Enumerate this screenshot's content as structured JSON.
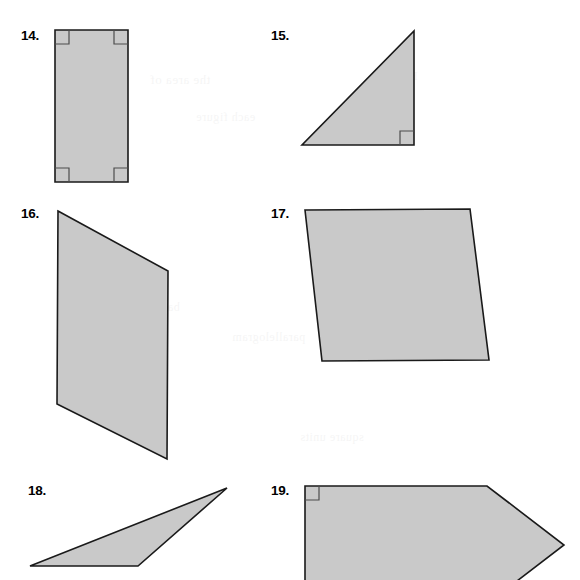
{
  "page": {
    "background_color": "#ffffff",
    "width": 580,
    "height": 580
  },
  "style": {
    "shape_fill": "#c9c9c9",
    "shape_stroke": "#1a1a1a",
    "shape_stroke_width": 1.6,
    "marker_stroke": "#4d4d4d",
    "marker_stroke_width": 1.2,
    "label_color": "#000000"
  },
  "ghost_text": [
    {
      "text": "the area of",
      "x": 150,
      "y": 72,
      "size": 13
    },
    {
      "text": "Find",
      "x": 392,
      "y": 68,
      "size": 13
    },
    {
      "text": "each figure",
      "x": 196,
      "y": 110,
      "size": 12
    },
    {
      "text": "parallelogram",
      "x": 232,
      "y": 330,
      "size": 12
    },
    {
      "text": "triangle",
      "x": 404,
      "y": 260,
      "size": 12
    },
    {
      "text": "base height",
      "x": 120,
      "y": 300,
      "size": 12
    },
    {
      "text": "square units",
      "x": 300,
      "y": 430,
      "size": 12
    }
  ],
  "items": [
    {
      "number": "14.",
      "label_name": "item-label-14",
      "shape_name": "shape-rectangle",
      "shape_type": "rectangle",
      "vertices": [
        [
          55,
          30
        ],
        [
          128,
          30
        ],
        [
          128,
          182
        ],
        [
          55,
          182
        ]
      ],
      "right_angle_markers": [
        {
          "corner": "top-left",
          "path": "M 55 44 L 69 44 L 69 30"
        },
        {
          "corner": "top-right",
          "path": "M 128 44 L 114 44 L 114 30"
        },
        {
          "corner": "bottom-left",
          "path": "M 55 168 L 69 168 L 69 182"
        },
        {
          "corner": "bottom-right",
          "path": "M 128 168 L 114 168 L 114 182"
        }
      ]
    },
    {
      "number": "15.",
      "label_name": "item-label-15",
      "shape_name": "shape-right-triangle",
      "shape_type": "right-triangle",
      "vertices": [
        [
          302,
          145
        ],
        [
          414,
          145
        ],
        [
          414,
          31
        ]
      ],
      "right_angle_markers": [
        {
          "corner": "bottom-right",
          "path": "M 400 145 L 400 131 L 414 131"
        }
      ]
    },
    {
      "number": "16.",
      "label_name": "item-label-16",
      "shape_name": "shape-parallelogram-tall",
      "shape_type": "parallelogram",
      "vertices": [
        [
          58,
          211
        ],
        [
          168,
          271
        ],
        [
          167,
          459
        ],
        [
          57,
          404
        ]
      ],
      "right_angle_markers": []
    },
    {
      "number": "17.",
      "label_name": "item-label-17",
      "shape_name": "shape-parallelogram-wide",
      "shape_type": "parallelogram",
      "vertices": [
        [
          305,
          210
        ],
        [
          470,
          209
        ],
        [
          489,
          360
        ],
        [
          322,
          361
        ]
      ],
      "right_angle_markers": []
    },
    {
      "number": "18.",
      "label_name": "item-label-18",
      "shape_name": "shape-obtuse-triangle",
      "shape_type": "triangle",
      "vertices": [
        [
          30,
          566
        ],
        [
          138,
          566
        ],
        [
          227,
          488
        ]
      ],
      "right_angle_markers": []
    },
    {
      "number": "19.",
      "label_name": "item-label-19",
      "shape_name": "shape-pentagon",
      "shape_type": "pentagon",
      "vertices": [
        [
          305,
          486
        ],
        [
          487,
          486
        ],
        [
          564,
          545
        ],
        [
          487,
          604
        ],
        [
          305,
          604
        ]
      ],
      "right_angle_markers": [
        {
          "corner": "top-left",
          "path": "M 305 500 L 319 500 L 319 486"
        }
      ]
    }
  ]
}
